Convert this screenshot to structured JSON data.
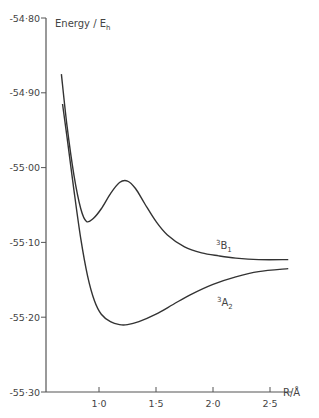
{
  "chart_data": {
    "type": "line",
    "title": "",
    "xlabel": "R/Å",
    "ylabel": "Energy / E_h",
    "xlim": [
      0.535,
      2.75
    ],
    "ylim": [
      -55.3,
      -54.8
    ],
    "grid": false,
    "legend": "none (inline curve labels)",
    "x_ticks": [
      1.0,
      1.5,
      2.0,
      2.5
    ],
    "x_tick_labels": [
      "1·0",
      "1·5",
      "2·0",
      "2·5"
    ],
    "y_ticks": [
      -54.8,
      -54.9,
      -55.0,
      -55.1,
      -55.2,
      -55.3
    ],
    "y_tick_labels": [
      "-54·80",
      "-54·90",
      "-55·00",
      "-55·10",
      "-55·20",
      "-55·30"
    ],
    "series": [
      {
        "name": "3B1",
        "label_main": "B",
        "label_sup": "3",
        "label_sub": "1",
        "x": [
          0.67,
          0.72,
          0.78,
          0.84,
          0.89,
          0.95,
          1.02,
          1.1,
          1.18,
          1.25,
          1.32,
          1.4,
          1.5,
          1.6,
          1.75,
          1.9,
          2.05,
          2.2,
          2.4,
          2.66
        ],
        "y": [
          -54.875,
          -54.945,
          -55.01,
          -55.055,
          -55.072,
          -55.068,
          -55.055,
          -55.035,
          -55.02,
          -55.018,
          -55.028,
          -55.048,
          -55.072,
          -55.09,
          -55.106,
          -55.114,
          -55.118,
          -55.121,
          -55.123,
          -55.123
        ]
      },
      {
        "name": "3A2",
        "label_main": "A",
        "label_sup": "3",
        "label_sub": "2",
        "x": [
          0.68,
          0.72,
          0.78,
          0.84,
          0.9,
          0.96,
          1.02,
          1.1,
          1.18,
          1.25,
          1.35,
          1.5,
          1.65,
          1.8,
          2.0,
          2.2,
          2.4,
          2.66
        ],
        "y": [
          -54.915,
          -54.96,
          -55.03,
          -55.095,
          -55.145,
          -55.178,
          -55.196,
          -55.206,
          -55.21,
          -55.21,
          -55.206,
          -55.196,
          -55.183,
          -55.17,
          -55.156,
          -55.146,
          -55.139,
          -55.135
        ]
      }
    ]
  },
  "labels": {
    "ylabel_main": "Energy / E",
    "ylabel_sub": "h",
    "xlabel": "R/Å",
    "b1_sup": "3",
    "b1_main": "B",
    "b1_sub": "1",
    "a2_sup": "3",
    "a2_main": "A",
    "a2_sub": "2"
  }
}
